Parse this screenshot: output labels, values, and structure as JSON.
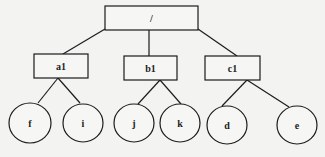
{
  "diagram": {
    "type": "tree",
    "root": {
      "id": "root",
      "label": "/",
      "shape": "rect",
      "x": 105,
      "y": 6,
      "w": 93,
      "h": 24
    },
    "level1": [
      {
        "id": "a1",
        "label": "a1",
        "shape": "rect",
        "x": 34,
        "y": 54,
        "w": 54,
        "h": 24
      },
      {
        "id": "b1",
        "label": "b1",
        "shape": "rect",
        "x": 124,
        "y": 56,
        "w": 53,
        "h": 24
      },
      {
        "id": "c1",
        "label": "c1",
        "shape": "rect",
        "x": 205,
        "y": 56,
        "w": 55,
        "h": 24
      }
    ],
    "leaves": [
      {
        "id": "f",
        "label": "f",
        "shape": "circle",
        "cx": 30,
        "cy": 123,
        "r": 21,
        "parent": "a1"
      },
      {
        "id": "i",
        "label": "i",
        "shape": "circle",
        "cx": 83,
        "cy": 123,
        "r": 20,
        "parent": "a1"
      },
      {
        "id": "j",
        "label": "j",
        "shape": "circle",
        "cx": 134,
        "cy": 123,
        "r": 20,
        "parent": "b1"
      },
      {
        "id": "k",
        "label": "k",
        "shape": "circle",
        "cx": 180,
        "cy": 123,
        "r": 20,
        "parent": "b1"
      },
      {
        "id": "d",
        "label": "d",
        "shape": "circle",
        "cx": 227,
        "cy": 125,
        "r": 20,
        "parent": "c1"
      },
      {
        "id": "e",
        "label": "e",
        "shape": "circle",
        "cx": 297,
        "cy": 125,
        "r": 20,
        "parent": "c1"
      }
    ],
    "edges": [
      {
        "from": "root",
        "to": "a1",
        "x1": 105,
        "y1": 29,
        "x2": 63,
        "y2": 54
      },
      {
        "from": "root",
        "to": "b1",
        "x1": 149,
        "y1": 30,
        "x2": 149,
        "y2": 56
      },
      {
        "from": "root",
        "to": "c1",
        "x1": 198,
        "y1": 29,
        "x2": 237,
        "y2": 56
      },
      {
        "from": "a1",
        "to": "f",
        "x1": 58,
        "y1": 78,
        "x2": 38,
        "y2": 103
      },
      {
        "from": "a1",
        "to": "i",
        "x1": 58,
        "y1": 78,
        "x2": 80,
        "y2": 103
      },
      {
        "from": "b1",
        "to": "j",
        "x1": 160,
        "y1": 80,
        "x2": 138,
        "y2": 104
      },
      {
        "from": "b1",
        "to": "k",
        "x1": 160,
        "y1": 80,
        "x2": 181,
        "y2": 104
      },
      {
        "from": "c1",
        "to": "d",
        "x1": 247,
        "y1": 80,
        "x2": 222,
        "y2": 106
      },
      {
        "from": "c1",
        "to": "e",
        "x1": 247,
        "y1": 80,
        "x2": 289,
        "y2": 107
      }
    ]
  }
}
